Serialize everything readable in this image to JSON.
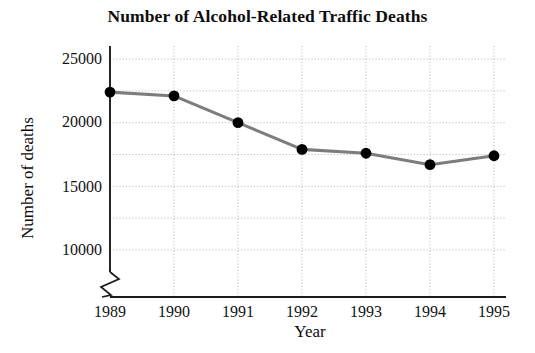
{
  "chart_data": {
    "type": "line",
    "title": "Number of Alcohol-Related Traffic Deaths",
    "xlabel": "Year",
    "ylabel": "Number of deaths",
    "categories": [
      "1989",
      "1990",
      "1991",
      "1992",
      "1993",
      "1994",
      "1995"
    ],
    "values": [
      22400,
      22100,
      20000,
      17900,
      17600,
      16700,
      17400
    ],
    "series": [
      {
        "name": "Alcohol-related traffic deaths",
        "values": [
          22400,
          22100,
          20000,
          17900,
          17600,
          16700,
          17400
        ]
      }
    ],
    "ylim": [
      8750,
      25000
    ],
    "ytick_labels": [
      "10000",
      "15000",
      "20000",
      "25000"
    ],
    "ytick_values": [
      10000,
      15000,
      20000,
      25000
    ],
    "gridline_values": [
      10000,
      12500,
      15000,
      17500,
      20000,
      22500,
      25000
    ],
    "grid": "dotted-both-axes",
    "legend": "none",
    "axis_break": true,
    "axis_break_note": "y-axis broken below 10000",
    "line_color": "#7d7d7d",
    "marker_color": "#000000",
    "grid_color": "#b4b4b4",
    "axis_color": "#1a1a1a",
    "text_color": "#0d0d0d"
  }
}
